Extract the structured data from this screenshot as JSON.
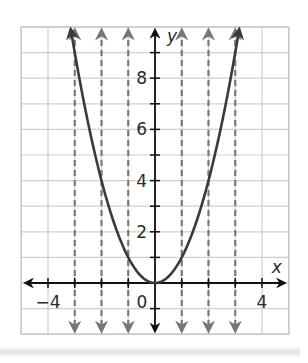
{
  "chart_data": {
    "type": "line",
    "title": "",
    "xlabel": "x",
    "ylabel": "y",
    "xlim": [
      -5,
      5
    ],
    "ylim": [
      -2,
      10
    ],
    "grid": true,
    "x_ticks": [
      -4,
      -3,
      -2,
      -1,
      1,
      2,
      3,
      4
    ],
    "x_tick_labels": [
      {
        "value": -4,
        "label": "−4"
      },
      {
        "value": 0,
        "label": "0"
      },
      {
        "value": 4,
        "label": "4"
      }
    ],
    "y_ticks": [
      -1,
      1,
      2,
      3,
      4,
      5,
      6,
      7,
      8,
      9
    ],
    "y_tick_labels": [
      {
        "value": 2,
        "label": "2"
      },
      {
        "value": 4,
        "label": "4"
      },
      {
        "value": 6,
        "label": "6"
      },
      {
        "value": 8,
        "label": "8"
      }
    ],
    "series": [
      {
        "name": "y = x^2",
        "style": "solid",
        "color": "#3a3a3a",
        "function": "x^2",
        "x_range": [
          -3.15,
          3.15
        ],
        "points": [
          [
            -3,
            9
          ],
          [
            -2,
            4
          ],
          [
            -1,
            1
          ],
          [
            0,
            0
          ],
          [
            1,
            1
          ],
          [
            2,
            4
          ],
          [
            3,
            9
          ]
        ]
      }
    ],
    "vertical_dashed_lines": {
      "color": "#7a7a7a",
      "x_values": [
        -3,
        -2,
        -1,
        1,
        2,
        3
      ],
      "arrows": "both ends"
    },
    "axis_color": "#111111",
    "grid_color": "#cfcfcf"
  }
}
